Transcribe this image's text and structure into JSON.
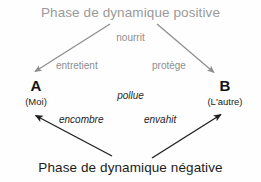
{
  "diagram": {
    "title_positive": "Phase de dynamique positive",
    "title_negative": "Phase de dynamique négative",
    "nodes": [
      {
        "id": "a",
        "letter": "A",
        "sub": "(Moi)"
      },
      {
        "id": "b",
        "letter": "B",
        "sub": "(L'autre)"
      }
    ],
    "edge_labels": {
      "nourrit": "nourrit",
      "entretient": "entretient",
      "protege": "protège",
      "pollue": "pollue",
      "encombre": "encombre",
      "envahit": "envahit"
    },
    "colors": {
      "positive_gray": "#9a9a9a",
      "positive_label_gray": "#8e8e8e",
      "negative_black": "#1c1c1c",
      "arrow_gray": "#8d8d8d",
      "arrow_black": "#1f1f1f",
      "background": "#fefefe"
    },
    "arrows": [
      {
        "name": "positive-to-a",
        "from": [
          110,
          24
        ],
        "to": [
          33,
          73
        ],
        "color": "#8d8d8d"
      },
      {
        "name": "positive-to-b",
        "from": [
          157,
          24
        ],
        "to": [
          216,
          74
        ],
        "color": "#8d8d8d"
      },
      {
        "name": "negative-to-a",
        "from": [
          112,
          156
        ],
        "to": [
          33,
          114
        ],
        "color": "#1f1f1f"
      },
      {
        "name": "negative-to-b",
        "from": [
          152,
          158
        ],
        "to": [
          223,
          113
        ],
        "color": "#1f1f1f"
      }
    ]
  }
}
